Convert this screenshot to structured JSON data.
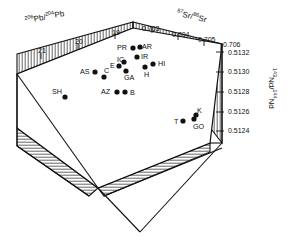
{
  "figure": {
    "type": "3d-isotope-scatter"
  },
  "axes": {
    "pb": {
      "title_pre": "206",
      "title_mid": "Pb/",
      "title_sup2": "204",
      "title_end": "Pb",
      "ticks": [
        "21",
        "20",
        "19"
      ],
      "tick_x": [
        38,
        75,
        112
      ],
      "tick_y": [
        47,
        38,
        29
      ]
    },
    "sr": {
      "title_pre": "87",
      "title_mid": "Sr/",
      "title_sup2": "86",
      "title_end": "Sr",
      "ticks": [
        "0.703",
        "0.704",
        "0.705",
        "0.706"
      ],
      "tick_x": [
        142,
        172,
        198,
        223
      ],
      "tick_y": [
        25,
        31,
        36,
        41
      ]
    },
    "nd": {
      "title_pre": "143",
      "title_mid": "Nd/",
      "title_sup2": "144",
      "title_end": "Nd",
      "ticks": [
        "0.5132",
        "0.5130",
        "0.5128",
        "0.5126",
        "0.5124"
      ],
      "tick_x": [
        228,
        228,
        228,
        228,
        228
      ],
      "tick_y": [
        49,
        68,
        88,
        108,
        127
      ]
    }
  },
  "points": [
    {
      "id": "SH",
      "label": "SH",
      "cx": 65,
      "cy": 97,
      "lx": 52,
      "ly": 88
    },
    {
      "id": "AS",
      "label": "AS",
      "cx": 95,
      "cy": 72,
      "lx": 80,
      "ly": 68
    },
    {
      "id": "C",
      "label": "C",
      "cx": 104,
      "cy": 77,
      "lx": 104,
      "ly": 67
    },
    {
      "id": "AZ",
      "label": "AZ",
      "cx": 117,
      "cy": 92,
      "lx": 101,
      "ly": 88
    },
    {
      "id": "B",
      "label": "B",
      "cx": 125,
      "cy": 92,
      "lx": 130,
      "ly": 89
    },
    {
      "id": "E",
      "label": "E",
      "cx": 119,
      "cy": 66,
      "lx": 110,
      "ly": 62
    },
    {
      "id": "IC",
      "label": "IC",
      "cx": 124,
      "cy": 62,
      "lx": 117,
      "ly": 56
    },
    {
      "id": "GA",
      "label": "GA",
      "cx": 126,
      "cy": 71,
      "lx": 124,
      "ly": 74
    },
    {
      "id": "PR",
      "label": "PR",
      "cx": 133,
      "cy": 48,
      "lx": 117,
      "ly": 44
    },
    {
      "id": "AR",
      "label": "AR",
      "cx": 140,
      "cy": 47,
      "lx": 142,
      "ly": 43
    },
    {
      "id": "IR",
      "label": "IR",
      "cx": 137,
      "cy": 57,
      "lx": 141,
      "ly": 53
    },
    {
      "id": "H",
      "label": "H",
      "cx": 145,
      "cy": 67,
      "lx": 144,
      "ly": 71
    },
    {
      "id": "HI",
      "label": "HI",
      "cx": 153,
      "cy": 64,
      "lx": 158,
      "ly": 60
    },
    {
      "id": "T",
      "label": "T",
      "cx": 183,
      "cy": 121,
      "lx": 174,
      "ly": 118
    },
    {
      "id": "K",
      "label": "K",
      "cx": 196,
      "cy": 115,
      "lx": 197,
      "ly": 107
    },
    {
      "id": "GO",
      "label": "GO",
      "cx": 194,
      "cy": 119,
      "lx": 193,
      "ly": 123
    }
  ]
}
